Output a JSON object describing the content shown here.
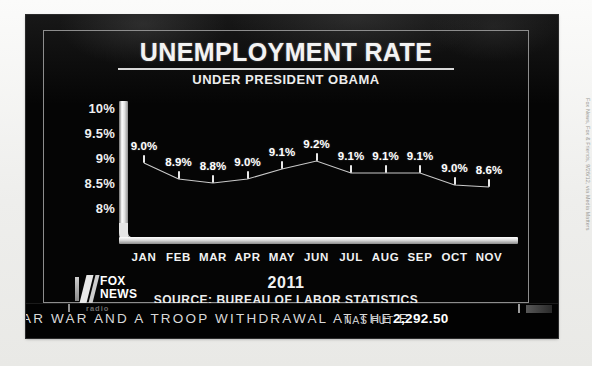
{
  "credit": "Fox News, Fox & Friends, 9/26/12, via Media Matters",
  "broadcast": {
    "title": "UNEMPLOYMENT RATE",
    "subtitle": "UNDER PRESIDENT OBAMA",
    "year": "2011",
    "source": "SOURCE: BUREAU OF LABOR STATISTICS",
    "logo": {
      "line1": "FOX",
      "line2": "NEWS",
      "line3": "radio"
    }
  },
  "ticker": {
    "headline": "AR WAR AND A TROOP WITHDRAWAL AT THE E",
    "symbol": "NAS FUT",
    "value": "2,292.50",
    "bug": "radio"
  },
  "chart_data": {
    "type": "line",
    "title": "UNEMPLOYMENT RATE",
    "subtitle": "UNDER PRESIDENT OBAMA",
    "xlabel": "2011",
    "ylabel": "",
    "source": "SOURCE: BUREAU OF LABOR STATISTICS",
    "grid": false,
    "legend": "none",
    "ylim": [
      8,
      10
    ],
    "yticks": [
      "8%",
      "8.5%",
      "9%",
      "9.5%",
      "10%"
    ],
    "ytick_values": [
      8,
      8.5,
      9,
      9.5,
      10
    ],
    "categories": [
      "JAN",
      "FEB",
      "MAR",
      "APR",
      "MAY",
      "JUN",
      "JUL",
      "AUG",
      "SEP",
      "OCT",
      "NOV"
    ],
    "values": [
      9.0,
      8.9,
      8.8,
      9.0,
      9.1,
      9.2,
      9.1,
      9.1,
      9.1,
      9.0,
      8.6
    ],
    "data_labels": [
      "9.0%",
      "8.9%",
      "8.8%",
      "9.0%",
      "9.1%",
      "9.2%",
      "9.1%",
      "9.1%",
      "9.1%",
      "9.0%",
      "8.6%"
    ],
    "note": "Vertical axis is not to scale; plotted marker heights are nearly flat in the original broadcast graphic.",
    "marker_pixel_y": [
      56,
      72,
      76,
      72,
      62,
      54,
      66,
      66,
      66,
      78,
      80
    ]
  }
}
